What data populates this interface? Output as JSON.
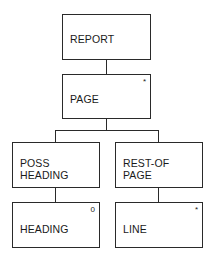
{
  "diagram": {
    "type": "Jackson structure diagram",
    "nodes": [
      {
        "id": "report",
        "label": "REPORT",
        "marker": ""
      },
      {
        "id": "page",
        "label": "PAGE",
        "marker": "*"
      },
      {
        "id": "poss-heading",
        "label": "POSS\nHEADING",
        "marker": ""
      },
      {
        "id": "rest-of-page",
        "label": "REST-OF\nPAGE",
        "marker": ""
      },
      {
        "id": "heading",
        "label": "HEADING",
        "marker": "0"
      },
      {
        "id": "line",
        "label": "LINE",
        "marker": "*"
      }
    ],
    "edges": [
      {
        "from": "report",
        "to": "page"
      },
      {
        "from": "page",
        "to": "poss-heading"
      },
      {
        "from": "page",
        "to": "rest-of-page"
      },
      {
        "from": "poss-heading",
        "to": "heading"
      },
      {
        "from": "rest-of-page",
        "to": "line"
      }
    ]
  }
}
